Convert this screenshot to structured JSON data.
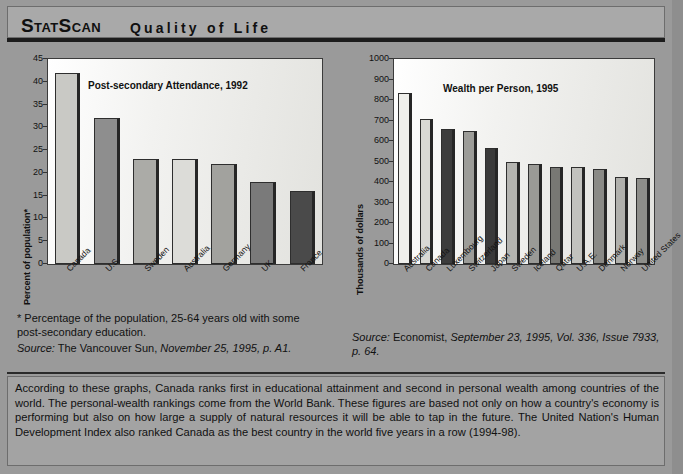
{
  "header": {
    "brand": "StatScan",
    "title": "Quality of Life"
  },
  "chart_data": [
    {
      "type": "bar",
      "title": "Post-secondary Attendance, 1992",
      "xlabel": "",
      "ylabel": "Percent of population*",
      "categories": [
        "Canada",
        "U.S.",
        "Sweden",
        "Australia",
        "Germany",
        "UK",
        "France"
      ],
      "values": [
        42,
        32,
        23,
        23,
        22,
        18,
        16
      ],
      "bar_colors": [
        "#c9c9c5",
        "#8e8e8e",
        "#ababa7",
        "#dcdcd8",
        "#a2a29e",
        "#7a7a7a",
        "#4a4a4a"
      ],
      "yticks": [
        0,
        5,
        10,
        15,
        20,
        25,
        30,
        35,
        40,
        45
      ],
      "ylim": [
        0,
        45
      ],
      "grid": false,
      "legend": "none"
    },
    {
      "type": "bar",
      "title": "Wealth per Person, 1995",
      "xlabel": "",
      "ylabel": "Thousands of dollars",
      "categories": [
        "Australia",
        "Canada",
        "Luxembourg",
        "Switzerland",
        "Japan",
        "Sweden",
        "Iceland",
        "Qatar",
        "U.A.E.",
        "Denmark",
        "Norway",
        "United States"
      ],
      "values": [
        835,
        705,
        658,
        648,
        565,
        497,
        488,
        473,
        472,
        463,
        423,
        420
      ],
      "bar_colors": [
        "#efefeb",
        "#d8d8d4",
        "#3c3c3c",
        "#9c9c98",
        "#3a3a3a",
        "#b4b4b0",
        "#9a9a96",
        "#787874",
        "#c2c2be",
        "#8a8a86",
        "#b0b0ac",
        "#8e8e8a"
      ],
      "yticks": [
        0,
        100,
        200,
        300,
        400,
        500,
        600,
        700,
        800,
        900,
        1000
      ],
      "ylim": [
        0,
        1000
      ],
      "grid": false,
      "legend": "none"
    }
  ],
  "notes": {
    "left_footnote": "* Percentage of the population, 25-64 years old with some post-secondary education.",
    "left_source_label": "Source:",
    "left_source_plain": " The Vancouver Sun, ",
    "left_source_italic": "November 25, 1995, p. A1.",
    "right_source_label": "Source:",
    "right_source_plain": " Economist, ",
    "right_source_italic": "September 23, 1995, Vol. 336, Issue 7933, p. 64."
  },
  "summary": {
    "text": "According to these graphs, Canada ranks first in educational attainment and second in personal wealth among countries of the world. The personal-wealth rankings come from the World Bank. These figures are based not only on how a country's economy is performing but also on how large a supply of natural resources it will be able to tap in the future. The United Nation's Human Development Index also ranked Canada as the best country in the world five years in a row (1994-98)."
  }
}
